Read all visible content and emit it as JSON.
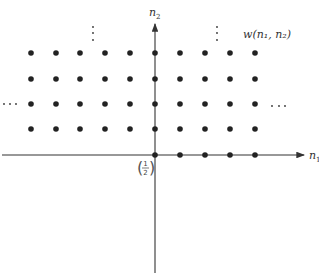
{
  "diagram": {
    "axes": {
      "horizontal_label": "n",
      "horizontal_subscript": "1",
      "vertical_label": "n",
      "vertical_subscript": "2"
    },
    "region_label": "w(n₁, n₂)",
    "origin_weight": {
      "numerator": "1",
      "denominator": "2"
    },
    "ellipsis_horizontal": "· · ·",
    "ellipsis_vertical": "⋮",
    "dot_grid": {
      "columns_x": [
        31,
        56,
        80,
        105,
        130,
        155,
        180,
        205,
        230,
        255
      ],
      "rows_y": [
        53,
        79,
        104,
        129
      ],
      "axis_row_x": [
        155,
        180,
        205,
        230,
        255
      ],
      "axis_row_y": 155
    },
    "colors": {
      "dot": "#222222",
      "axis": "#333333",
      "text": "#333333"
    }
  }
}
